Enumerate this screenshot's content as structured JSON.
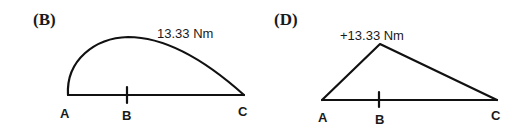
{
  "diagrams": [
    {
      "panel_label": "(B)",
      "shape": "curved",
      "peak_label": "13.33 Nm",
      "points": {
        "A": "A",
        "B": "B",
        "C": "C"
      }
    },
    {
      "panel_label": "(D)",
      "shape": "triangular",
      "peak_label": "+13.33 Nm",
      "points": {
        "A": "A",
        "B": "B",
        "C": "C"
      }
    }
  ]
}
